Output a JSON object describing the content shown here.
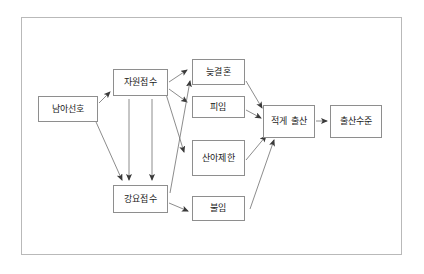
{
  "diagram": {
    "type": "causal-flow-diagram",
    "frame": {
      "border_color": "#b9b9b9"
    },
    "node_border_color": "#8e8e8e",
    "edge_color": "#6f6f6f",
    "nodes": [
      {
        "id": "son_preference",
        "label": "남아선호",
        "x": 38,
        "y": 96,
        "w": 60,
        "h": 26
      },
      {
        "id": "voluntary_intake",
        "label": "자원접수",
        "x": 113,
        "y": 69,
        "w": 55,
        "h": 27
      },
      {
        "id": "forced_intake",
        "label": "강요접수",
        "x": 113,
        "y": 185,
        "w": 55,
        "h": 28
      },
      {
        "id": "late_marriage",
        "label": "늦결혼",
        "x": 192,
        "y": 59,
        "w": 53,
        "h": 26
      },
      {
        "id": "contraception",
        "label": "피임",
        "x": 192,
        "y": 96,
        "w": 53,
        "h": 22
      },
      {
        "id": "birth_control",
        "label": "산아제한",
        "x": 192,
        "y": 140,
        "w": 53,
        "h": 36
      },
      {
        "id": "infertility",
        "label": "불임",
        "x": 192,
        "y": 196,
        "w": 53,
        "h": 25
      },
      {
        "id": "fewer_births",
        "label": "적게 출산",
        "x": 263,
        "y": 105,
        "w": 52,
        "h": 33
      },
      {
        "id": "fertility_level",
        "label": "출산수준",
        "x": 330,
        "y": 105,
        "w": 52,
        "h": 33
      }
    ],
    "edges": [
      {
        "from": "son_preference",
        "to": "voluntary_intake"
      },
      {
        "from": "son_preference",
        "to": "forced_intake"
      },
      {
        "from": "voluntary_intake",
        "to": "forced_intake"
      },
      {
        "from": "voluntary_intake",
        "to": "forced_intake"
      },
      {
        "from": "voluntary_intake",
        "to": "late_marriage"
      },
      {
        "from": "voluntary_intake",
        "to": "contraception"
      },
      {
        "from": "forced_intake",
        "to": "late_marriage"
      },
      {
        "from": "voluntary_intake",
        "to": "birth_control"
      },
      {
        "from": "forced_intake",
        "to": "infertility"
      },
      {
        "from": "late_marriage",
        "to": "fewer_births"
      },
      {
        "from": "contraception",
        "to": "fewer_births"
      },
      {
        "from": "birth_control",
        "to": "fewer_births"
      },
      {
        "from": "infertility",
        "to": "fewer_births"
      },
      {
        "from": "fewer_births",
        "to": "fertility_level"
      }
    ]
  }
}
